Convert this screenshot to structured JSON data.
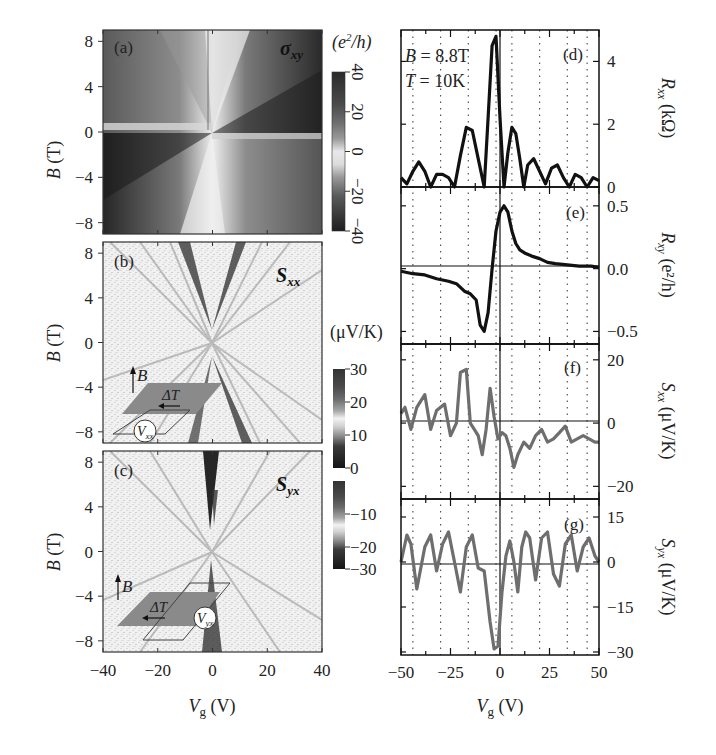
{
  "chart_data": [
    {
      "id": "a",
      "type": "heatmap",
      "panel_label": "(a)",
      "quantity": "σxy",
      "quantity_main": "σ",
      "quantity_sub": "xy",
      "xlabel": "Vg (V)",
      "ylabel": "B (T)",
      "xlim": [
        -40,
        40
      ],
      "ylim": [
        -9,
        9
      ],
      "xticks": [
        -40,
        -20,
        0,
        20,
        40
      ],
      "yticks": [
        8,
        4,
        0,
        -4,
        -8
      ],
      "colorbar": {
        "unit": "(e²/h)",
        "ticks": [
          40,
          20,
          0,
          -20,
          -40
        ],
        "range": [
          -40,
          40
        ],
        "orientation": "vertical, rotated labels"
      },
      "description": "Fan pattern of Landau levels; antisymmetric in B, dark for |σxy| large, light near Vg=0 and B=0"
    },
    {
      "id": "b",
      "type": "heatmap",
      "panel_label": "(b)",
      "quantity": "Sxx",
      "quantity_main": "S",
      "quantity_sub": "xx",
      "xlabel": "Vg (V)",
      "ylabel": "B (T)",
      "xlim": [
        -40,
        40
      ],
      "ylim": [
        -9,
        9
      ],
      "xticks": [
        -40,
        -20,
        0,
        20,
        40
      ],
      "yticks": [
        8,
        4,
        0,
        -4,
        -8
      ],
      "colorbar": {
        "unit": "(μV/K)",
        "ticks": [
          30,
          20,
          10,
          0,
          -10,
          -20,
          -30
        ],
        "range": [
          -30,
          30
        ]
      },
      "inset": {
        "labels": [
          "B",
          "ΔT",
          "Vxx"
        ]
      }
    },
    {
      "id": "c",
      "type": "heatmap",
      "panel_label": "(c)",
      "quantity": "Syx",
      "quantity_main": "S",
      "quantity_sub": "yx",
      "xlabel": "Vg (V)",
      "ylabel": "B (T)",
      "xlim": [
        -40,
        40
      ],
      "ylim": [
        -9,
        9
      ],
      "xticks": [
        -40,
        -20,
        0,
        20,
        40
      ],
      "yticks": [
        8,
        4,
        0,
        -4,
        -8
      ],
      "colorbar": {
        "unit": "(μV/K)",
        "ticks": [
          30,
          20,
          10,
          0,
          -10,
          -20,
          -30
        ],
        "range": [
          -30,
          30
        ]
      },
      "inset": {
        "labels": [
          "B",
          "ΔT",
          "Vyx"
        ]
      }
    },
    {
      "id": "d",
      "type": "line",
      "panel_label": "(d)",
      "annotations": [
        "B = 8.8T",
        "T = 10K"
      ],
      "ylabel": "Rxx (kΩ)",
      "ylim": [
        0,
        5
      ],
      "yticks": [
        0,
        2,
        4
      ],
      "xlim": [
        -50,
        50
      ],
      "x": [
        -50,
        -47,
        -44,
        -41,
        -38,
        -35,
        -32,
        -29,
        -26,
        -23,
        -20,
        -17,
        -14,
        -11,
        -8,
        -6,
        -4,
        -2,
        0,
        2,
        4,
        6,
        8,
        10,
        12,
        14,
        17,
        20,
        23,
        26,
        29,
        32,
        35,
        38,
        41,
        44,
        47,
        50
      ],
      "values": [
        0.3,
        0.1,
        0.5,
        0.8,
        0.5,
        0.0,
        0.4,
        0.4,
        0.3,
        0.0,
        1.0,
        1.9,
        1.8,
        0.9,
        0.0,
        2.2,
        4.5,
        4.8,
        2.2,
        0.0,
        1.1,
        1.9,
        1.7,
        0.9,
        0.0,
        0.7,
        0.9,
        0.5,
        0.1,
        0.6,
        0.7,
        0.3,
        0.0,
        0.4,
        0.3,
        0.0,
        0.3,
        0.2
      ]
    },
    {
      "id": "e",
      "type": "line",
      "panel_label": "(e)",
      "ylabel": "Rxy (e²/h)",
      "ylim": [
        -0.6,
        0.65
      ],
      "yticks": [
        0.5,
        0.0,
        -0.5
      ],
      "xlim": [
        -50,
        50
      ],
      "x": [
        -50,
        -44,
        -38,
        -32,
        -26,
        -22,
        -18,
        -15,
        -12,
        -10,
        -8,
        -6,
        -4,
        -2,
        0,
        2,
        4,
        6,
        8,
        10,
        13,
        16,
        20,
        24,
        28,
        34,
        40,
        46,
        50
      ],
      "values": [
        -0.02,
        -0.04,
        -0.05,
        -0.08,
        -0.1,
        -0.12,
        -0.18,
        -0.2,
        -0.25,
        -0.45,
        -0.5,
        -0.35,
        0.0,
        0.3,
        0.45,
        0.5,
        0.45,
        0.3,
        0.2,
        0.15,
        0.12,
        0.1,
        0.08,
        0.05,
        0.04,
        0.03,
        0.02,
        0.02,
        0.01
      ]
    },
    {
      "id": "f",
      "type": "line",
      "panel_label": "(f)",
      "ylabel": "Sxx (μV/K)",
      "ylim": [
        -24,
        25
      ],
      "yticks": [
        20,
        0,
        -20
      ],
      "xlim": [
        -50,
        50
      ],
      "x": [
        -50,
        -48,
        -45,
        -42,
        -38,
        -35,
        -32,
        -28,
        -25,
        -22,
        -20,
        -17,
        -15,
        -13,
        -11,
        -9,
        -7,
        -5,
        -3,
        -1,
        1,
        3,
        5,
        7,
        9,
        12,
        15,
        18,
        21,
        24,
        27,
        30,
        33,
        36,
        39,
        42,
        45,
        48,
        50
      ],
      "values": [
        3,
        5,
        -2,
        5,
        9,
        -2,
        4,
        6,
        -4,
        0,
        16,
        17,
        0,
        -2,
        -4,
        -10,
        -2,
        11,
        2,
        -5,
        -3,
        -4,
        -8,
        -14,
        -10,
        -6,
        -8,
        -4,
        -2,
        -6,
        -5,
        -3,
        -1,
        -6,
        -5,
        -4,
        -5,
        -6,
        -6
      ]
    },
    {
      "id": "g",
      "type": "line",
      "panel_label": "(g)",
      "ylabel": "Syx (μV/K)",
      "ylim": [
        -31,
        21
      ],
      "yticks": [
        15,
        0,
        -15,
        -30
      ],
      "xlim": [
        -50,
        50
      ],
      "x": [
        -50,
        -47,
        -45,
        -42,
        -38,
        -35,
        -32,
        -29,
        -26,
        -23,
        -20,
        -17,
        -14,
        -11,
        -8,
        -5,
        -3,
        -1,
        1,
        3,
        5,
        7,
        9,
        11,
        13,
        15,
        18,
        21,
        24,
        27,
        30,
        33,
        36,
        39,
        42,
        45,
        48,
        50
      ],
      "values": [
        0,
        9,
        6,
        -9,
        5,
        9,
        -3,
        6,
        10,
        0,
        -10,
        5,
        9,
        -2,
        -3,
        -20,
        -29,
        -28,
        -10,
        2,
        7,
        0,
        -10,
        5,
        10,
        8,
        -6,
        8,
        10,
        -4,
        -8,
        6,
        9,
        -3,
        5,
        8,
        2,
        0
      ]
    }
  ],
  "left": {
    "xlabel_main": "V",
    "xlabel_sub": "g",
    "xlabel_unit": " (V)",
    "ylabel_main": "B",
    "ylabel_unit": " (T)",
    "xticks": [
      "−40",
      "−20",
      "0",
      "20",
      "40"
    ],
    "yticks": [
      "8",
      "4",
      "0",
      "−4",
      "−8"
    ],
    "panels": [
      {
        "label": "(a)",
        "qty_main": "σ",
        "qty_sub": "xy"
      },
      {
        "label": "(b)",
        "qty_main": "S",
        "qty_sub": "xx"
      },
      {
        "label": "(c)",
        "qty_main": "S",
        "qty_sub": "yx"
      }
    ],
    "cbar_a": {
      "unit_main": "(e",
      "unit_sup": "2",
      "unit_tail": "/h)",
      "ticks": [
        "40",
        "20",
        "0",
        "−20",
        "−40"
      ]
    },
    "cbar_bc": {
      "unit": "(μV/K)",
      "ticks": [
        "30",
        "20",
        "10",
        "0",
        "−10",
        "−20",
        "−30"
      ]
    },
    "inset_b": {
      "B": "B",
      "dT": "ΔT",
      "V": "V",
      "Vsub": "xx"
    },
    "inset_c": {
      "B": "B",
      "dT": "ΔT",
      "V": "V",
      "Vsub": "yx"
    }
  },
  "right": {
    "xlabel_main": "V",
    "xlabel_sub": "g",
    "xlabel_unit": " (V)",
    "xticks": [
      "−50",
      "−25",
      "0",
      "25",
      "50"
    ],
    "d": {
      "label": "(d)",
      "ann1": "B = 8.8T",
      "ann1_var": "B",
      "ann1_rest": " = 8.8T",
      "ann2_var": "T",
      "ann2_rest": " = 10K",
      "yticks": [
        "4",
        "2",
        "0"
      ],
      "ylabel_main": "R",
      "ylabel_sub": "xx",
      "ylabel_unit": " (kΩ)"
    },
    "e": {
      "label": "(e)",
      "yticks": [
        "0.5",
        "0.0",
        "−0.5"
      ],
      "ylabel_main": "R",
      "ylabel_sub": "xy",
      "ylabel_unit": " (e²/h)"
    },
    "f": {
      "label": "(f)",
      "yticks": [
        "20",
        "0",
        "−20"
      ],
      "ylabel_main": "S",
      "ylabel_sub": "xx",
      "ylabel_unit": " (μV/K)"
    },
    "g": {
      "label": "(g)",
      "yticks": [
        "15",
        "0",
        "−15",
        "−30"
      ],
      "ylabel_main": "S",
      "ylabel_sub": "yx",
      "ylabel_unit": " (μV/K)"
    }
  },
  "colors": {
    "curve_black": "#111111",
    "curve_gray": "#6e6e6e",
    "frame": "#222222",
    "inset_sample": "#8a8a8a"
  }
}
